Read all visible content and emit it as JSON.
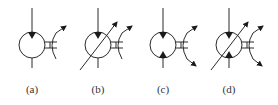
{
  "figure": {
    "type": "hydraulic-symbols",
    "colors": {
      "line": "#2b2b2b",
      "fill": "#1a1a1a",
      "background": "#ffffff",
      "text": "#333333"
    },
    "symbols": [
      {
        "id": "a",
        "label": "(a)",
        "cx": 32,
        "variable": false,
        "triangles": [
          "top"
        ],
        "arc_arrows": [
          "top"
        ]
      },
      {
        "id": "b",
        "label": "(b)",
        "cx": 98,
        "variable": true,
        "triangles": [
          "top"
        ],
        "arc_arrows": [
          "top"
        ]
      },
      {
        "id": "c",
        "label": "(c)",
        "cx": 163,
        "variable": false,
        "triangles": [
          "top",
          "bottom"
        ],
        "arc_arrows": [
          "top",
          "bottom"
        ]
      },
      {
        "id": "d",
        "label": "(d)",
        "cx": 229,
        "variable": true,
        "triangles": [
          "top",
          "bottom"
        ],
        "arc_arrows": [
          "top",
          "bottom"
        ]
      }
    ]
  }
}
